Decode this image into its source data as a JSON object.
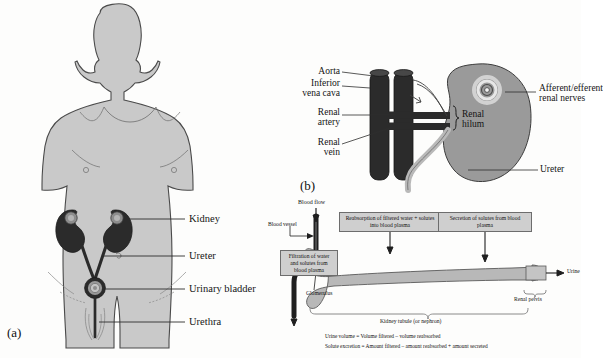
{
  "figure": {
    "background_color": "#fdfdfc",
    "body_fill": "#c9c9c9",
    "organ_dark": "#2b2b2b",
    "kidney_gray": "#9a9a9a",
    "box_fill": "#cfcfcf",
    "line_color": "#2e2e2e"
  },
  "panel_a": {
    "tag": "(a)",
    "caption": "Whole-body view of the urinary system",
    "labels": [
      {
        "id": "kidney",
        "text": "Kidney"
      },
      {
        "id": "ureter",
        "text": "Ureter"
      },
      {
        "id": "urinary-bladder",
        "text": "Urinary bladder"
      },
      {
        "id": "urethra",
        "text": "Urethra"
      }
    ]
  },
  "panel_b": {
    "tag": "(b)",
    "caption": "Kidney with renal blood vessels and hilum",
    "labels_left": [
      {
        "id": "aorta",
        "text": "Aorta"
      },
      {
        "id": "inferior-vena-cava",
        "text": "Inferior\nvena cava"
      },
      {
        "id": "renal-artery",
        "text": "Renal\nartery"
      },
      {
        "id": "renal-vein",
        "text": "Renal\nvein"
      }
    ],
    "labels_right": [
      {
        "id": "renal-nerves",
        "text": "Afferent/efferent\nrenal nerves"
      },
      {
        "id": "ureter",
        "text": "Ureter"
      }
    ],
    "labels_inner": [
      {
        "id": "renal-hilum",
        "text": "Renal\nhilum"
      }
    ]
  },
  "panel_c": {
    "tag": "",
    "caption": "Kidney tubule (nephron) functional processes",
    "callout_boxes": [
      {
        "id": "filtration",
        "text": "Filtration of\nwater and solutes\nfrom blood plasma"
      },
      {
        "id": "reabsorption",
        "text": "Reabsorption of filtered water +\nsolutes into blood plasma"
      },
      {
        "id": "secretion",
        "text": "Secretion of solutes from\nblood plasma"
      }
    ],
    "labels": [
      {
        "id": "blood-flow",
        "text": "Blood flow"
      },
      {
        "id": "blood-vessel",
        "text": "Blood vessel"
      },
      {
        "id": "glomerulus",
        "text": "Glomerulus"
      },
      {
        "id": "urine",
        "text": "Urine"
      },
      {
        "id": "renal-pelvis",
        "text": "Renal pelvis"
      },
      {
        "id": "kidney-tubule",
        "text": "Kidney tubule (or nephron)"
      }
    ],
    "equations": [
      "Urine volume = Volume filtered – volume reabsorbed",
      "Solute excretion = Amount filtered – amount reabsorbed + amount secreted"
    ]
  }
}
